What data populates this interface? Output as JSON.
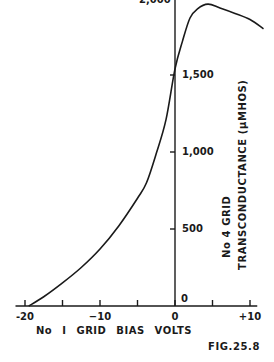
{
  "chart_data": {
    "type": "line",
    "title": "",
    "figure_label": "FIG.25.8",
    "xlabel": "No I GRID BIAS VOLTS",
    "ylabel_line1": "No 4 GRID",
    "ylabel_line2": "TRANSCONDUCTANCE (μMHOS)",
    "xlim": [
      -21,
      11.5
    ],
    "ylim": [
      0,
      2000
    ],
    "x_ticks": [
      -20,
      -15,
      -10,
      -5,
      0,
      5,
      10
    ],
    "x_tick_labels": [
      {
        "value": -20,
        "label": "-20"
      },
      {
        "value": -10,
        "label": "−10"
      },
      {
        "value": 0,
        "label": "0"
      },
      {
        "value": 10,
        "label": "+10"
      }
    ],
    "y_ticks": [
      0,
      500,
      1000,
      1500,
      2000
    ],
    "y_tick_labels": [
      {
        "value": 0,
        "label": "0"
      },
      {
        "value": 500,
        "label": "500"
      },
      {
        "value": 1000,
        "label": "1,000"
      },
      {
        "value": 1500,
        "label": "1,500"
      },
      {
        "value": 2000,
        "label": "2,000"
      }
    ],
    "grid": false,
    "legend": null,
    "series": [
      {
        "name": "No 4 grid transconductance",
        "x": [
          -19.5,
          -17.5,
          -15,
          -12.5,
          -10,
          -7.5,
          -5,
          -3.8,
          -2.5,
          -1.2,
          0,
          1,
          2,
          3,
          4.4,
          6,
          8,
          10,
          11.8
        ],
        "y": [
          0,
          60,
          150,
          250,
          370,
          520,
          700,
          800,
          990,
          1210,
          1540,
          1720,
          1870,
          1930,
          1960,
          1935,
          1900,
          1860,
          1800
        ]
      }
    ]
  }
}
